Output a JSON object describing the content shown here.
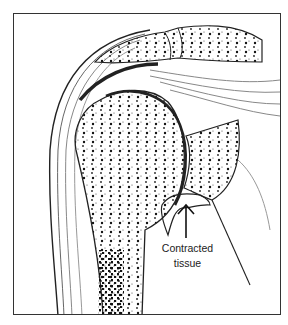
{
  "figure": {
    "annotation": {
      "line1": "Contracted",
      "line2": "tissue",
      "arrow": "up-arrow"
    }
  },
  "colors": {
    "ink": "#222222",
    "background": "#ffffff",
    "frame": "#333333"
  }
}
